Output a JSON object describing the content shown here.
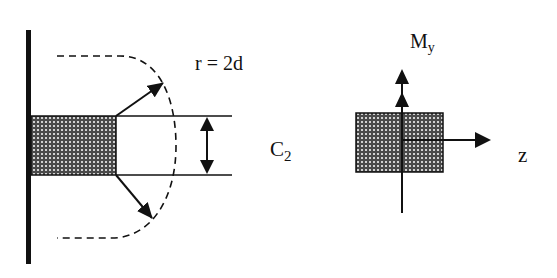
{
  "diagram": {
    "type": "structural-section-sketch",
    "colors": {
      "ink": "#111111",
      "background": "#ffffff",
      "hatch_bg": "#555555"
    },
    "left_figure": {
      "radius_label": "r = 2d",
      "dimension_label_main": "C",
      "dimension_label_sub": "2",
      "elements": [
        "wall",
        "hatched-column-section",
        "dashed-critical-perimeter",
        "radial-arrows",
        "dimension-arrow"
      ]
    },
    "right_figure": {
      "moment_label_main": "M",
      "moment_label_sub": "y",
      "axis_label": "z",
      "elements": [
        "hatched-section",
        "vertical-axis-double-arrow",
        "horizontal-axis-arrow"
      ]
    }
  }
}
